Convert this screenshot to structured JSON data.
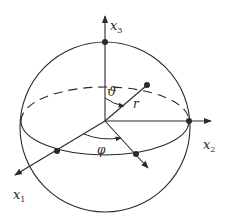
{
  "diagram": {
    "axes": {
      "x1": {
        "label": "x",
        "subscript": "1"
      },
      "x2": {
        "label": "x",
        "subscript": "2"
      },
      "x3": {
        "label": "x",
        "subscript": "3"
      }
    },
    "labels": {
      "radius": "r",
      "polar_angle": "ϑ",
      "azimuth_angle": "φ"
    },
    "colors": {
      "stroke": "#2a2a2a",
      "background": "#ffffff"
    }
  }
}
